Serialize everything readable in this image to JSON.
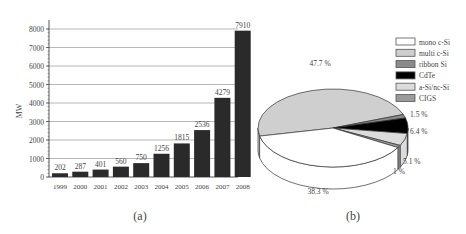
{
  "chart_data": [
    {
      "type": "bar",
      "panel_label": "(a)",
      "title": "",
      "xlabel": "",
      "ylabel": "MW",
      "ylim": [
        0,
        8000
      ],
      "yticks": [
        0,
        1000,
        2000,
        3000,
        4000,
        5000,
        6000,
        7000,
        8000
      ],
      "grid": true,
      "categories": [
        "1999",
        "2000",
        "2001",
        "2002",
        "2003",
        "2004",
        "2005",
        "2006",
        "2007",
        "2008"
      ],
      "values": [
        202,
        287,
        401,
        560,
        750,
        1256,
        1815,
        2536,
        4279,
        7910
      ],
      "bar_color": "#2a2a2a"
    },
    {
      "type": "pie",
      "panel_label": "(b)",
      "style": "3d",
      "legend_position": "upper right",
      "slices": [
        {
          "label": "mono c-Si",
          "value": 38.3,
          "text": "38.3 %",
          "color": "#ffffff"
        },
        {
          "label": "multi c-Si",
          "value": 47.7,
          "text": "47.7 %",
          "color": "#cfcfcf"
        },
        {
          "label": "ribbon Si",
          "value": 1.5,
          "text": "1.5 %",
          "color": "#8a8a8a"
        },
        {
          "label": "CdTe",
          "value": 6.4,
          "text": "6.4 %",
          "color": "#000000"
        },
        {
          "label": "a-Si/nc-Si",
          "value": 5.1,
          "text": "5.1 %",
          "color": "#dcdcdc"
        },
        {
          "label": "CIGS",
          "value": 1.0,
          "text": "1 %",
          "color": "#9a9a9a"
        }
      ]
    }
  ],
  "labels": {
    "panel_a": "(a)",
    "panel_b": "(b)",
    "ylabel": "MW"
  }
}
